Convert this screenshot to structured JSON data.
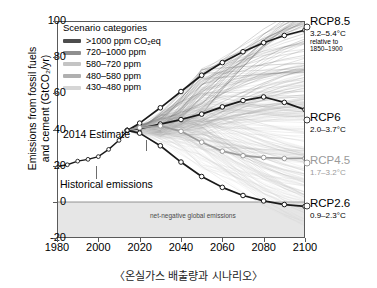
{
  "caption": "〈온실가스 배출량과 시나리오〉",
  "axes": {
    "ylabel_line1": "Emissions from fossil fuels",
    "ylabel_line2": "and cement (GtCO₂/yr)",
    "yticks": [
      "100",
      "80",
      "60",
      "40",
      "20",
      "0",
      "-20"
    ],
    "ytick_values": [
      100,
      80,
      60,
      40,
      20,
      0,
      -20
    ],
    "xticks": [
      "1980",
      "2000",
      "2020",
      "2040",
      "2060",
      "2080",
      "2100"
    ],
    "xtick_values": [
      1980,
      2000,
      2020,
      2040,
      2060,
      2080,
      2100
    ],
    "xlim": [
      1980,
      2100
    ],
    "ylim": [
      -20,
      100
    ]
  },
  "legend": {
    "title": "Scenario categories",
    "items": [
      {
        "label": ">1000 ppm CO₂eq",
        "color": "#4d4d4d"
      },
      {
        "label": "720–1000 ppm",
        "color": "#8f8f8f"
      },
      {
        "label": "580–720 ppm",
        "color": "#c4c4c4"
      },
      {
        "label": "480–580 ppm",
        "color": "#b0b0b0"
      },
      {
        "label": "430–480 ppm",
        "color": "#d6d6d6"
      }
    ]
  },
  "annotations": {
    "estimate_2014": "2014 Estimate",
    "historical": "Historical emissions",
    "net_negative": "net-negative global emissions"
  },
  "rcp_labels": [
    {
      "name": "RCP8.5",
      "temp": "3.2–5.4°C",
      "note_line1": "relative to",
      "note_line2": "1850–1900",
      "color": "#1a1a1a"
    },
    {
      "name": "RCP6",
      "temp": "2.0–3.7°C",
      "color": "#1a1a1a"
    },
    {
      "name": "RCP4.5",
      "temp": "1.7–3.2°C",
      "color": "#9a9a9a"
    },
    {
      "name": "RCP2.6",
      "temp": "0.9–2.3°C",
      "color": "#1a1a1a"
    }
  ],
  "chart_data": {
    "type": "line",
    "title": "〈온실가스 배출량과 시나리오〉",
    "xlabel": "",
    "ylabel": "Emissions from fossil fuels and cement (GtCO2/yr)",
    "xlim": [
      1980,
      2100
    ],
    "ylim": [
      -20,
      100
    ],
    "grid": false,
    "legend_position": "top-left",
    "historical": {
      "name": "Historical emissions",
      "x": [
        1980,
        1985,
        1990,
        1995,
        2000,
        2005,
        2010,
        2014
      ],
      "y": [
        19.5,
        20.5,
        22.5,
        23.5,
        25.0,
        29.0,
        34.0,
        39.5
      ]
    },
    "series": [
      {
        "name": "RCP8.5",
        "color": "#1a1a1a",
        "x": [
          2014,
          2020,
          2030,
          2040,
          2050,
          2060,
          2070,
          2080,
          2090,
          2100
        ],
        "y": [
          39.5,
          43.5,
          52.0,
          61.0,
          70.0,
          77.0,
          83.0,
          88.0,
          92.0,
          95.0
        ]
      },
      {
        "name": "RCP6",
        "color": "#1a1a1a",
        "x": [
          2014,
          2020,
          2030,
          2040,
          2050,
          2060,
          2070,
          2080,
          2090,
          2100
        ],
        "y": [
          39.5,
          40.5,
          43.0,
          45.5,
          48.5,
          52.5,
          56.0,
          58.0,
          55.0,
          51.0
        ]
      },
      {
        "name": "RCP4.5",
        "color": "#9a9a9a",
        "x": [
          2014,
          2020,
          2030,
          2040,
          2050,
          2060,
          2070,
          2080,
          2090,
          2100
        ],
        "y": [
          39.5,
          41.0,
          42.0,
          39.0,
          33.0,
          28.0,
          25.5,
          24.5,
          24.0,
          24.0
        ]
      },
      {
        "name": "RCP2.6",
        "color": "#1a1a1a",
        "x": [
          2014,
          2020,
          2030,
          2040,
          2050,
          2060,
          2070,
          2080,
          2090,
          2100
        ],
        "y": [
          39.5,
          38.0,
          31.0,
          22.0,
          14.0,
          8.0,
          3.5,
          0.5,
          -1.5,
          -2.5
        ]
      }
    ],
    "scenario_band": {
      "description": "Spaghetti of individual scenario pathways shaded by CO2eq concentration category",
      "categories": [
        ">1000 ppm CO2eq",
        "720-1000 ppm",
        "580-720 ppm",
        "480-580 ppm",
        "430-480 ppm"
      ]
    },
    "net_negative_region": {
      "label": "net-negative global emissions",
      "y_range": [
        -20,
        0
      ]
    }
  }
}
